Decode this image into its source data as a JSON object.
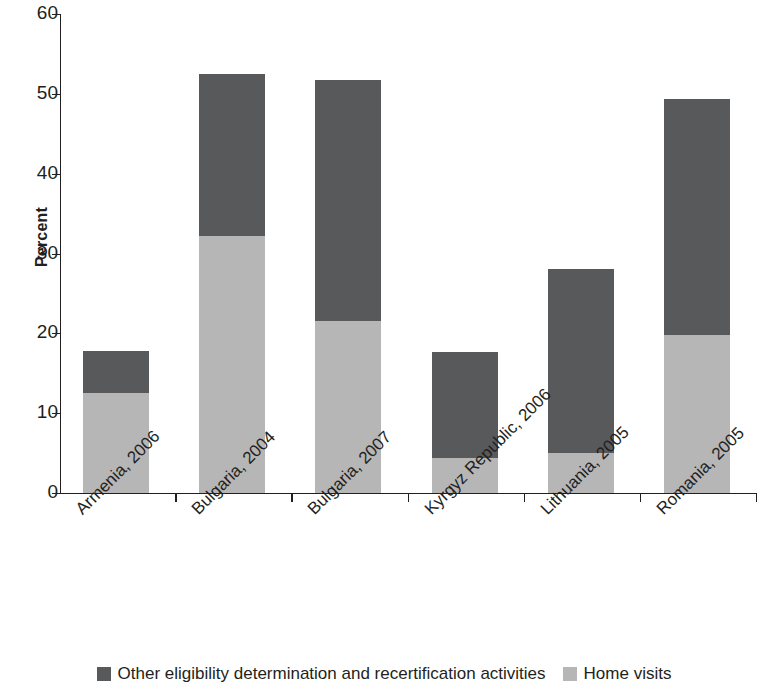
{
  "chart_data": {
    "type": "bar",
    "subtype": "stacked-vertical",
    "title": "",
    "xlabel": "",
    "ylabel": "Percent",
    "ylim": [
      0,
      60
    ],
    "yticks": [
      0,
      10,
      20,
      30,
      40,
      50,
      60
    ],
    "ytick_labels": [
      "0",
      "10",
      "20",
      "30",
      "40",
      "50",
      "60"
    ],
    "grid": false,
    "legend_position": "bottom",
    "categories": [
      "Armenia, 2006",
      "Bulgaria, 2004",
      "Bulgaria, 2007",
      "Kyrgyz Republic, 2006",
      "Lithuania, 2005",
      "Romania, 2005"
    ],
    "series": [
      {
        "name": "Home visits",
        "color": "#b6b6b6",
        "values": [
          12.5,
          32.2,
          21.5,
          4.4,
          5.0,
          19.8
        ]
      },
      {
        "name": "Other eligibility determination and recertification activities",
        "color": "#58595b",
        "values": [
          5.3,
          20.3,
          30.2,
          13.3,
          23.0,
          29.6
        ]
      }
    ],
    "totals": [
      17.8,
      52.5,
      51.7,
      17.7,
      28.0,
      49.4
    ]
  },
  "axis": {
    "y_title": "Percent"
  },
  "legend": {
    "items": [
      {
        "label": "Other eligibility determination and recertification activities",
        "color": "#58595b"
      },
      {
        "label": "Home visits",
        "color": "#b6b6b6"
      }
    ]
  }
}
